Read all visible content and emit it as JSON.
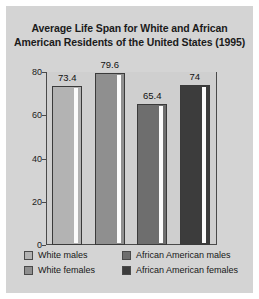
{
  "figure": {
    "panel_bg": "#d4d4d4",
    "plot_bg": "#cfcfcf",
    "axis_color": "#4a4a4a"
  },
  "title": {
    "line1": "Average Life Span for White and African",
    "line2": "American Residents of the United States (1995)"
  },
  "chart_data": {
    "type": "bar",
    "title": "Average Life Span for White and African American Residents of the United States (1995)",
    "xlabel": "",
    "ylabel": "",
    "ylim": [
      0,
      80
    ],
    "yticks": [
      0,
      20,
      40,
      60,
      80
    ],
    "grid": false,
    "legend_position": "bottom",
    "categories": [
      "White males",
      "White females",
      "African American males",
      "African American females"
    ],
    "values": [
      73.4,
      79.6,
      65.4,
      74
    ],
    "value_labels": [
      "73.4",
      "79.6",
      "65.4",
      "74"
    ],
    "bar_colors": [
      "#b3b3b3",
      "#8f8f8f",
      "#6e6e6e",
      "#3c3c3c"
    ]
  },
  "axis": {
    "tick_labels": [
      "80",
      "60",
      "40",
      "20",
      "0"
    ]
  },
  "legend": {
    "items": [
      {
        "label": "White males",
        "color": "#b3b3b3"
      },
      {
        "label": "White females",
        "color": "#8f8f8f"
      },
      {
        "label": "African American males",
        "color": "#6e6e6e"
      },
      {
        "label": "African American females",
        "color": "#3c3c3c"
      }
    ]
  }
}
